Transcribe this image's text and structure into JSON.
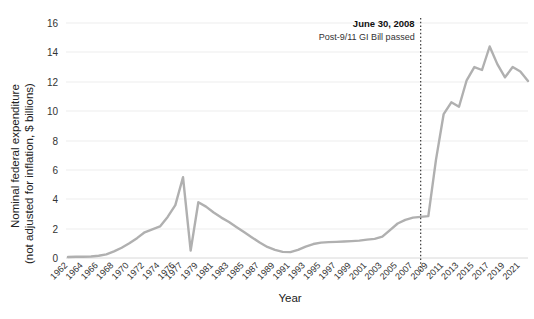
{
  "chart_data": {
    "type": "line",
    "title": "",
    "xlabel": "Year",
    "ylabel": "Nominal federal expenditure\n(not adjusted for inflation, $ billions)",
    "ylabel_line1": "Nominal federal expenditure",
    "ylabel_line2": "(not adjusted for inflation, $ billions)",
    "ylim": [
      0,
      16
    ],
    "yticks": [
      0,
      2,
      4,
      6,
      8,
      10,
      12,
      14,
      16
    ],
    "ytick_labels": [
      "0",
      "2",
      "4",
      "6",
      "8",
      "10",
      "12",
      "14",
      "16"
    ],
    "grid": true,
    "legend": "none",
    "categories": [
      "1962",
      "1963",
      "1964",
      "1965",
      "1966",
      "1967",
      "1968",
      "1969",
      "1970",
      "1971",
      "1972",
      "1973",
      "1974",
      "1975",
      "1976",
      "1977",
      "1978",
      "1979",
      "1980",
      "1981",
      "1982",
      "1983",
      "1984",
      "1985",
      "1986",
      "1987",
      "1988",
      "1989",
      "1990",
      "1991",
      "1992",
      "1993",
      "1994",
      "1995",
      "1996",
      "1997",
      "1998",
      "1999",
      "2000",
      "2001",
      "2002",
      "2003",
      "2004",
      "2005",
      "2006",
      "2007",
      "2008",
      "2009",
      "2010",
      "2011",
      "2012",
      "2013",
      "2014",
      "2015",
      "2016",
      "2017",
      "2018",
      "2019",
      "2020",
      "2021",
      "2022"
    ],
    "xtick_labels": [
      "1962",
      "1964",
      "1966",
      "1968",
      "1970",
      "1972",
      "1974",
      "1976",
      "1977",
      "1979",
      "1981",
      "1983",
      "1985",
      "1987",
      "1989",
      "1991",
      "1993",
      "1995",
      "1997",
      "1999",
      "2001",
      "2003",
      "2005",
      "2007",
      "2009",
      "2011",
      "2013",
      "2015",
      "2017",
      "2019",
      "2021"
    ],
    "series": [
      {
        "name": "Nominal federal expenditure",
        "color": "#b0b0b0",
        "values": [
          0.07,
          0.08,
          0.09,
          0.1,
          0.15,
          0.25,
          0.45,
          0.7,
          1.0,
          1.35,
          1.75,
          1.95,
          2.15,
          2.8,
          3.6,
          5.5,
          0.5,
          3.8,
          3.5,
          3.1,
          2.75,
          2.45,
          2.1,
          1.75,
          1.4,
          1.05,
          0.75,
          0.55,
          0.42,
          0.4,
          0.55,
          0.78,
          0.95,
          1.05,
          1.08,
          1.1,
          1.12,
          1.15,
          1.18,
          1.25,
          1.3,
          1.45,
          1.9,
          2.35,
          2.6,
          2.75,
          2.8,
          2.85,
          6.7,
          9.8,
          10.6,
          10.3,
          12.1,
          13.0,
          12.8,
          14.4,
          13.2,
          12.3,
          13.0,
          12.7,
          12.05
        ]
      }
    ],
    "annotations": [
      {
        "name": "post-911-gi-bill",
        "line1": "June 30, 2008",
        "line2": "Post-9/11 GI Bill passed",
        "x_value": "2008",
        "style": "dotted-vertical-line"
      }
    ],
    "colors": {
      "series": "#b0b0b0",
      "grid": "#ededed",
      "axis": "#d8d8d8",
      "text": "#222222",
      "event_line": "#3a3a3a"
    }
  }
}
